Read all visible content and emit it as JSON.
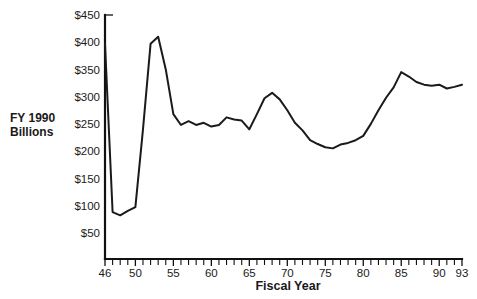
{
  "chart_data": {
    "type": "line",
    "title": "",
    "subtitle": "",
    "xlabel": "Fiscal Year",
    "ylabel": "FY 1990 Billions",
    "ylabel_line1": "FY 1990",
    "ylabel_line2": "Billions",
    "grid": false,
    "legend": "none",
    "xlim": [
      46,
      93
    ],
    "ylim": [
      0,
      450
    ],
    "ytick_labels": [
      "$450",
      "$400",
      "$350",
      "$300",
      "$250",
      "$200",
      "$150",
      "$100",
      "$50"
    ],
    "ytick_values": [
      450,
      400,
      350,
      300,
      250,
      200,
      150,
      100,
      50
    ],
    "xtick_labels": [
      "46",
      "50",
      "55",
      "60",
      "65",
      "70",
      "75",
      "80",
      "85",
      "90",
      "93"
    ],
    "xtick_values": [
      46,
      50,
      55,
      60,
      65,
      70,
      75,
      80,
      85,
      90,
      93
    ],
    "x_minor_tick_step": 1,
    "series": [
      {
        "name": "Defense Outlays",
        "x": [
          46,
          47,
          48,
          49,
          50,
          51,
          52,
          53,
          54,
          55,
          56,
          57,
          58,
          59,
          60,
          61,
          62,
          63,
          64,
          65,
          66,
          67,
          68,
          69,
          70,
          71,
          72,
          73,
          74,
          75,
          76,
          77,
          78,
          79,
          80,
          81,
          82,
          83,
          84,
          85,
          86,
          87,
          88,
          89,
          90,
          91,
          92,
          93
        ],
        "values": [
          397,
          88,
          82,
          90,
          97,
          240,
          397,
          410,
          350,
          268,
          248,
          255,
          248,
          252,
          245,
          248,
          262,
          258,
          256,
          240,
          268,
          297,
          307,
          295,
          275,
          252,
          238,
          220,
          213,
          207,
          205,
          212,
          215,
          220,
          228,
          250,
          275,
          298,
          317,
          345,
          337,
          327,
          322,
          320,
          322,
          315,
          318,
          322
        ]
      }
    ]
  },
  "plot_geometry": {
    "x_axis_pixel_start": 105,
    "x_axis_pixel_end": 462,
    "y_axis_pixel_top": 15,
    "y_value_top": 450,
    "y_pixel_per_unit": 0.5444
  }
}
